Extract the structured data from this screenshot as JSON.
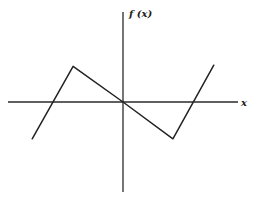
{
  "chart_data": {
    "type": "line",
    "title": "",
    "xlabel": "x",
    "ylabel": "f (x)",
    "grid": false,
    "legend": "none",
    "xlim": [
      -5,
      5
    ],
    "ylim": [
      -4,
      4
    ],
    "series": [
      {
        "name": "f(x)",
        "x": [
          -4.0,
          -2.2,
          0.0,
          2.2,
          4.0
        ],
        "y": [
          -1.6,
          1.55,
          0.0,
          -1.6,
          1.6
        ]
      }
    ],
    "annotations": []
  }
}
